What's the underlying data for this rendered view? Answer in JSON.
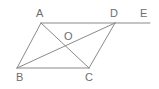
{
  "figure": {
    "type": "geometry-diagram",
    "width": 159,
    "height": 89,
    "background_color": "#ffffff",
    "stroke_color": "#8a8a8a",
    "label_color": "#6e6e6e",
    "stroke_width": 1
  },
  "points": {
    "A": {
      "label": "A",
      "x": 41,
      "y": 23,
      "label_x": 36,
      "label_y": 8
    },
    "B": {
      "label": "B",
      "x": 17,
      "y": 68,
      "label_x": 16,
      "label_y": 72
    },
    "C": {
      "label": "C",
      "x": 89,
      "y": 68,
      "label_x": 85,
      "label_y": 72
    },
    "D": {
      "label": "D",
      "x": 115,
      "y": 23,
      "label_x": 110,
      "label_y": 8
    },
    "E": {
      "label": "E",
      "x": 150,
      "y": 23,
      "label_x": 140,
      "label_y": 8
    },
    "O": {
      "label": "O",
      "x": 66,
      "y": 47,
      "label_x": 64,
      "label_y": 31
    }
  },
  "segments": [
    {
      "name": "segment-AD",
      "from": "A",
      "to": "D"
    },
    {
      "name": "segment-DE",
      "from": "D",
      "to": "E"
    },
    {
      "name": "segment-AB",
      "from": "A",
      "to": "B"
    },
    {
      "name": "segment-BC",
      "from": "B",
      "to": "C"
    },
    {
      "name": "segment-CD",
      "from": "C",
      "to": "D"
    },
    {
      "name": "diagonal-AC",
      "from": "A",
      "to": "C"
    },
    {
      "name": "diagonal-BD",
      "from": "B",
      "to": "D"
    }
  ]
}
